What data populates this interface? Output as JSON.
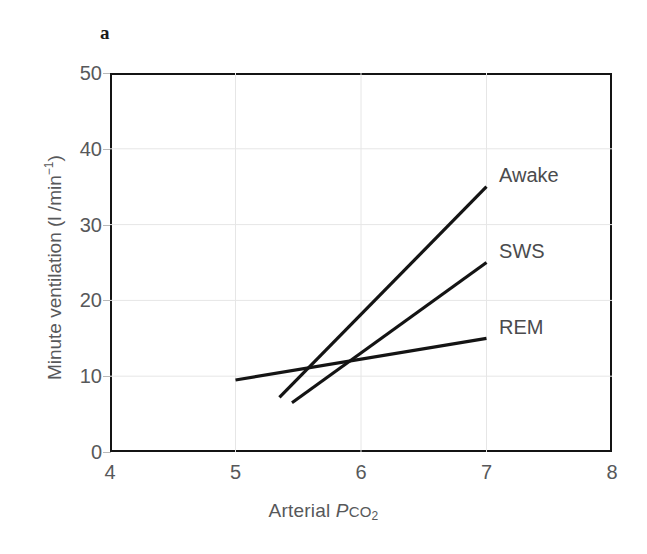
{
  "figure": {
    "panel_label": "a",
    "background_color": "#ffffff",
    "frame_color": "#141414",
    "grid_color": "#e6e6e6",
    "line_color": "#141414",
    "text_color": "#57585a"
  },
  "chart_data": {
    "type": "line",
    "title": "",
    "subtitle": "",
    "xlabel": "Arterial PCO2",
    "xlabel_parts": {
      "prefix": "Arterial ",
      "italic_p": "P",
      "smallcaps": "CO",
      "subscript": "2"
    },
    "ylabel": "Minute ventilation (l /min⁻¹)",
    "ylabel_parts": {
      "main": "Minute ventilation (l /min",
      "superscript": "−1",
      "suffix": ")"
    },
    "xlim": [
      4,
      8
    ],
    "ylim": [
      0,
      50
    ],
    "xticks": [
      4,
      5,
      6,
      7,
      8
    ],
    "xtick_labels": [
      "4",
      "5",
      "6",
      "7",
      "8"
    ],
    "yticks": [
      0,
      10,
      20,
      30,
      40,
      50
    ],
    "ytick_labels": [
      "0",
      "10",
      "20",
      "30",
      "40",
      "50"
    ],
    "grid": true,
    "grid_axes": "both",
    "legend_position": "inline-right-of-lines",
    "series": [
      {
        "name": "Awake",
        "label": "Awake",
        "x": [
          5.35,
          7.0
        ],
        "y": [
          7.2,
          35.0
        ],
        "label_x": 7.1,
        "label_y": 36.5
      },
      {
        "name": "SWS",
        "label": "SWS",
        "x": [
          5.45,
          7.0
        ],
        "y": [
          6.5,
          25.0
        ],
        "label_x": 7.1,
        "label_y": 26.5
      },
      {
        "name": "REM",
        "label": "REM",
        "x": [
          5.0,
          7.0
        ],
        "y": [
          9.5,
          15.0
        ],
        "label_x": 7.1,
        "label_y": 16.5
      }
    ]
  }
}
